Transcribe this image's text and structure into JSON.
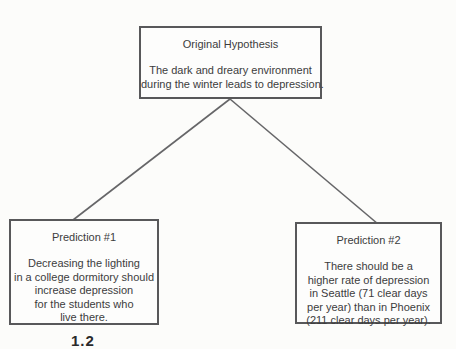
{
  "diagram": {
    "hypothesis_box": {
      "title": "Original Hypothesis",
      "lines": [
        "The dark and dreary environment",
        "during the winter leads to depression."
      ]
    },
    "prediction1_box": {
      "title": "Prediction #1",
      "lines": [
        "Decreasing the lighting",
        "in a college dormitory should",
        "increase depression",
        "for the students who",
        "live there."
      ]
    },
    "prediction2_box": {
      "title": "Prediction #2",
      "lines": [
        "There should be a",
        "higher rate of depression",
        "in Seattle (71 clear days",
        "per year) than in Phoenix",
        "(211 clear days per year)."
      ]
    },
    "caption_fragment": "1.2",
    "colors": {
      "paper_background": "#fcfcfa",
      "box_border": "#58585a",
      "text": "#3c3c3c",
      "connector_line": "#666668"
    }
  }
}
